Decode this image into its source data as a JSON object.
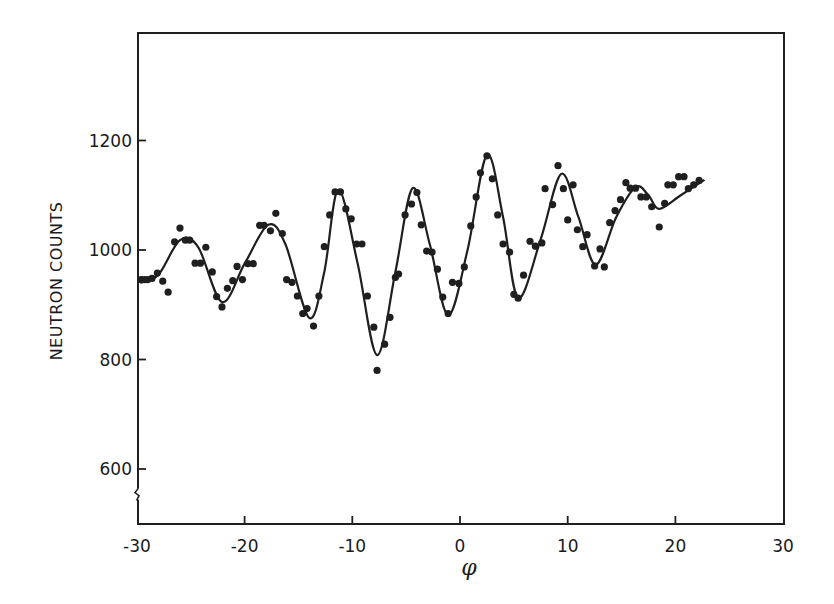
{
  "chart_data": {
    "type": "scatter",
    "title": "",
    "xlabel": "φ",
    "ylabel": "NEUTRON COUNTS",
    "xlim": [
      -30,
      30
    ],
    "ylim": [
      500,
      1400
    ],
    "x_ticks": [
      -30,
      -20,
      -10,
      0,
      10,
      20,
      30
    ],
    "x_tick_labels": [
      "-30",
      "-20",
      "-10",
      "0",
      "10",
      "20",
      "30"
    ],
    "y_ticks": [
      600,
      800,
      1000,
      1200
    ],
    "y_tick_labels": [
      "600",
      "800",
      "1000",
      "1200"
    ],
    "y_axis_break": 555,
    "grid": false,
    "legend": null,
    "series": [
      {
        "name": "measured",
        "kind": "points",
        "x": [
          -29.6,
          -29.3,
          -29.0,
          -28.6,
          -28.1,
          -27.6,
          -27.1,
          -26.5,
          -26.0,
          -25.5,
          -25.1,
          -24.6,
          -24.1,
          -23.6,
          -23.0,
          -22.6,
          -22.1,
          -21.6,
          -21.1,
          -20.7,
          -20.2,
          -19.7,
          -19.2,
          -18.6,
          -18.2,
          -17.6,
          -17.1,
          -16.5,
          -16.1,
          -15.6,
          -15.1,
          -14.6,
          -14.2,
          -13.6,
          -13.1,
          -12.6,
          -12.1,
          -11.6,
          -11.1,
          -10.6,
          -10.1,
          -9.6,
          -9.1,
          -8.6,
          -8.0,
          -7.7,
          -7.0,
          -6.5,
          -6.0,
          -5.7,
          -5.1,
          -4.5,
          -4.0,
          -3.6,
          -3.1,
          -2.6,
          -2.1,
          -1.6,
          -1.1,
          -0.7,
          -0.1,
          0.4,
          1.0,
          1.5,
          1.9,
          2.5,
          3.0,
          3.5,
          4.0,
          4.6,
          5.0,
          5.4,
          5.9,
          6.5,
          7.0,
          7.6,
          7.9,
          8.6,
          9.1,
          9.6,
          10.0,
          10.5,
          10.9,
          11.4,
          11.8,
          12.5,
          13.0,
          13.4,
          13.9,
          14.4,
          14.9,
          15.4,
          15.8,
          16.3,
          16.8,
          17.3,
          17.8,
          18.5,
          19.0,
          19.3,
          19.8,
          20.3,
          20.8,
          21.2,
          21.7,
          22.2
        ],
        "y": [
          946,
          946,
          946,
          948,
          958,
          943,
          923,
          1015,
          1040,
          1018,
          1018,
          976,
          976,
          1005,
          960,
          915,
          896,
          930,
          944,
          970,
          946,
          975,
          975,
          1045,
          1045,
          1035,
          1067,
          1030,
          946,
          941,
          916,
          884,
          893,
          861,
          916,
          1006,
          1064,
          1106,
          1106,
          1075,
          1057,
          1011,
          1011,
          916,
          859,
          780,
          828,
          877,
          950,
          956,
          1064,
          1084,
          1105,
          1046,
          998,
          996,
          965,
          914,
          884,
          941,
          939,
          969,
          1044,
          1097,
          1141,
          1172,
          1130,
          1064,
          1011,
          996,
          919,
          912,
          954,
          1016,
          1007,
          1013,
          1112,
          1083,
          1154,
          1112,
          1055,
          1119,
          1037,
          1006,
          1028,
          971,
          1002,
          969,
          1050,
          1072,
          1092,
          1123,
          1113,
          1113,
          1097,
          1097,
          1079,
          1042,
          1085,
          1119,
          1119,
          1134,
          1134,
          1112,
          1119,
          1127
        ]
      },
      {
        "name": "fit",
        "kind": "line",
        "x": [
          -29.7,
          -28.0,
          -26.0,
          -24.3,
          -22.1,
          -20.0,
          -17.8,
          -16.2,
          -14.0,
          -12.6,
          -11.3,
          -9.5,
          -7.7,
          -6.0,
          -4.4,
          -2.8,
          -1.1,
          0.7,
          2.5,
          4.0,
          5.4,
          7.5,
          9.4,
          11.0,
          12.6,
          14.5,
          16.3,
          17.5,
          18.5,
          20.5,
          22.7
        ],
        "y": [
          940,
          955,
          1018,
          1005,
          905,
          975,
          1046,
          1010,
          876,
          960,
          1110,
          975,
          808,
          960,
          1113,
          1010,
          881,
          1000,
          1174,
          1060,
          912,
          1020,
          1139,
          1060,
          973,
          1060,
          1115,
          1100,
          1075,
          1100,
          1128
        ]
      }
    ]
  }
}
